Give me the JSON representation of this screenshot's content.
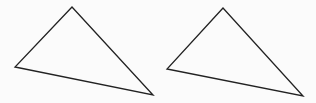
{
  "figure": {
    "background": "#fbfbfb",
    "stroke_color": "#222222",
    "stroke_width": 1.3,
    "shapes": [
      {
        "type": "triangle",
        "name": "left-triangle",
        "points": [
          [
            72,
            7
          ],
          [
            15,
            67
          ],
          [
            153,
            95
          ]
        ]
      },
      {
        "type": "triangle",
        "name": "right-triangle",
        "points": [
          [
            223,
            8
          ],
          [
            167,
            69
          ],
          [
            303,
            96
          ]
        ]
      }
    ]
  }
}
